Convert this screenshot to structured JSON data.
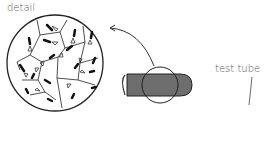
{
  "labels": {
    "detail": "detail",
    "test_tube": "test tube"
  },
  "colors": {
    "tube_fill": "#6e6e6e",
    "line": "#222222",
    "text": "#555555"
  }
}
